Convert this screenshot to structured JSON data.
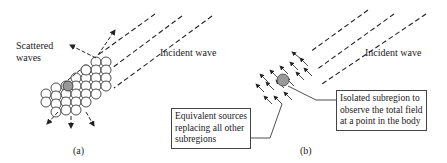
{
  "panel_a": {
    "caption": "(a)",
    "scattered_label_line1": "Scattered",
    "scattered_label_line2": "waves",
    "incident_label": "Incident wave"
  },
  "panel_b": {
    "caption": "(b)",
    "incident_label": "Incident wave",
    "equivalent_box": {
      "line1": "Equivalent sources",
      "line2": "replacing all other",
      "line3": "subregions"
    },
    "isolated_box": {
      "line1": "Isolated subregion to",
      "line2": "observe the total field",
      "line3": "at a point in the body"
    }
  },
  "colors": {
    "line": "#222222",
    "highlight_cell": "#999999"
  }
}
